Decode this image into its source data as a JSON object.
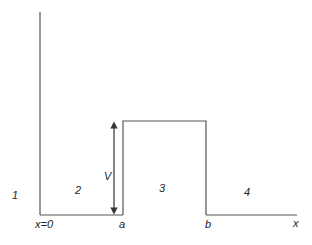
{
  "diagram": {
    "type": "potential-barrier",
    "regions": [
      {
        "label": "1",
        "x": 12,
        "y": 199
      },
      {
        "label": "2",
        "x": 75,
        "y": 194
      },
      {
        "label": "3",
        "x": 159,
        "y": 192
      },
      {
        "label": "4",
        "x": 244,
        "y": 196
      }
    ],
    "axis_labels": {
      "origin": "x=0",
      "a": "a",
      "b": "b",
      "x": "x"
    },
    "height_label": "V",
    "geometry": {
      "wall_x": 40,
      "wall_top": 12,
      "baseline_y": 215,
      "barrier_left_x": 123,
      "barrier_right_x": 206,
      "barrier_top_y": 121,
      "axis_end_x": 297,
      "arrow_x": 114
    },
    "colors": {
      "line": "#555555",
      "text": "#222222"
    }
  }
}
